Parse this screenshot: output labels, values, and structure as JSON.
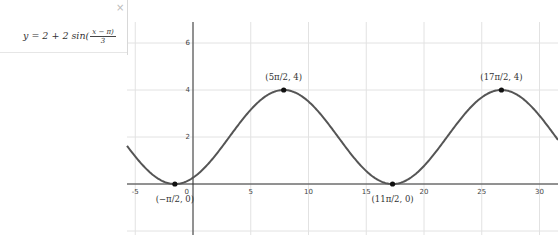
{
  "algebra": {
    "formula_prefix": "y = 2 + 2 sin(",
    "formula_num": "x − π)",
    "formula_den": "3",
    "close_label": "×"
  },
  "chart_data": {
    "type": "line",
    "title": "",
    "function": "y = 2 + 2 sin((x − π)/3)",
    "xlabel": "",
    "ylabel": "",
    "x_ticks": [
      -5,
      5,
      10,
      15,
      20,
      25,
      30
    ],
    "y_ticks": [
      2,
      4,
      6
    ],
    "origin_label": "0",
    "xlim": [
      -5.2,
      30.4
    ],
    "ylim": [
      -2.3,
      7.7
    ],
    "grid": true,
    "points": [
      {
        "label": "(−π/2, 0)",
        "x": -1.5708,
        "y": 0
      },
      {
        "label": "(5π/2, 4)",
        "x": 7.854,
        "y": 4
      },
      {
        "label": "(11π/2, 0)",
        "x": 17.279,
        "y": 0
      },
      {
        "label": "(17π/2, 4)",
        "x": 26.704,
        "y": 4
      }
    ],
    "colors": {
      "curve": "#555555",
      "grid": "#e2e2e2",
      "axis": "#333333",
      "point": "#111111"
    }
  }
}
